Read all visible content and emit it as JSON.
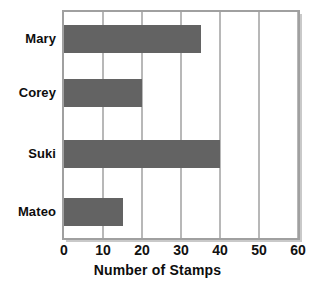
{
  "chart_data": {
    "type": "bar",
    "orientation": "horizontal",
    "title": "",
    "xlabel": "Number of Stamps",
    "ylabel": "",
    "xlim": [
      0,
      60
    ],
    "xticks": [
      0,
      10,
      20,
      30,
      40,
      50,
      60
    ],
    "grid": "vertical",
    "legend": "none",
    "categories": [
      "Mary",
      "Corey",
      "Suki",
      "Mateo"
    ],
    "values": [
      35,
      20,
      40,
      15
    ],
    "series": [
      {
        "name": "Number of Stamps",
        "values": [
          35,
          20,
          40,
          15
        ]
      }
    ],
    "bar_color": "#636363",
    "grid_color": "#b8b8b8",
    "frame_color": "#a0a0a0",
    "background_color": "#ffffff",
    "text_color": "#0d0d0d"
  }
}
